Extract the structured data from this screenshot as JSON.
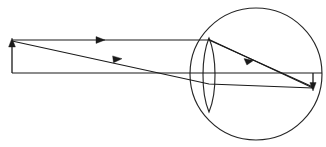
{
  "figure": {
    "type": "optics-ray-diagram",
    "background_color": "#ffffff",
    "stroke_color": "#1a1a1a",
    "width": 326,
    "height": 147
  },
  "elements": {
    "eyeball": {
      "name": "eyeball-circle",
      "center_x": 256,
      "center_y": 74,
      "radius": 66,
      "color": "#262626"
    },
    "lens": {
      "name": "crystalline-lens",
      "left_x": 200,
      "right_x": 218,
      "top_y": 38,
      "bottom_y": 112,
      "color": "#262626"
    },
    "object_arrow": {
      "name": "object-arrow",
      "base_x": 12,
      "base_y": 73,
      "tip_x": 12,
      "tip_y": 40,
      "direction": "up"
    },
    "optical_axis": {
      "name": "optical-axis",
      "start_x": 12,
      "start_y": 73,
      "end_x": 322,
      "end_y": 73
    },
    "image_arrow": {
      "name": "image-arrow-on-retina",
      "base_x": 313,
      "base_y": 73,
      "tip_x": 313,
      "tip_y": 89,
      "direction": "down",
      "note": "inverted real image formed at the retina"
    }
  },
  "rays": [
    {
      "name": "parallel-ray",
      "label": "ray parallel to axis, refracted through focal point",
      "points": "12,40 209,40 313,87",
      "arrow_at_x": 100,
      "arrow_at_y": 40
    },
    {
      "name": "oblique-ray",
      "label": "ray through optical centre of lens",
      "points": "12,41 209,84 313,88",
      "arrow_at_x": 117,
      "arrow_at_y": 57
    },
    {
      "name": "central-ray",
      "label": "ray from object tip through lens to retina",
      "points": "208,39 313,88",
      "arrow_at_x": 249,
      "arrow_at_y": 59
    }
  ],
  "arrowheads": [
    {
      "name": "parallel-ray-arrowhead",
      "x": 100,
      "y": 40,
      "angle": 0
    },
    {
      "name": "oblique-ray-arrowhead",
      "x": 117,
      "y": 57,
      "angle": 12
    },
    {
      "name": "central-ray-arrowhead",
      "x": 249,
      "y": 59,
      "angle": 25
    },
    {
      "name": "object-arrow-arrowhead",
      "x": 12,
      "y": 40,
      "angle": -90
    },
    {
      "name": "image-arrow-arrowhead",
      "x": 313,
      "y": 89,
      "angle": 90
    }
  ]
}
